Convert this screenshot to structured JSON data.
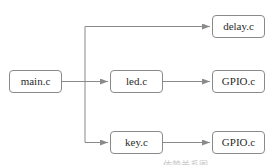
{
  "diagram": {
    "nodes": [
      {
        "id": "main",
        "label": "main.c"
      },
      {
        "id": "led",
        "label": "led.c"
      },
      {
        "id": "key",
        "label": "key.c"
      },
      {
        "id": "delay",
        "label": "delay.c"
      },
      {
        "id": "gpio1",
        "label": "GPIO.c"
      },
      {
        "id": "gpio2",
        "label": "GPIO.c"
      }
    ],
    "edges": [
      {
        "from": "main",
        "to": "delay"
      },
      {
        "from": "main",
        "to": "led"
      },
      {
        "from": "main",
        "to": "key"
      },
      {
        "from": "led",
        "to": "gpio1"
      },
      {
        "from": "key",
        "to": "gpio2"
      }
    ],
    "colors": {
      "line": "#8a8a8a",
      "border": "#8a8a8a",
      "text": "#2b2b2b"
    },
    "caption": "依赖关系图"
  }
}
